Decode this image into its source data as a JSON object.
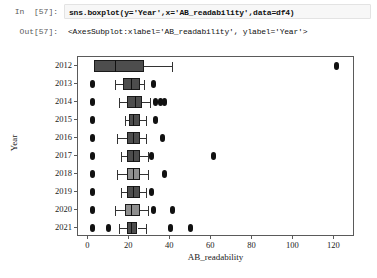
{
  "notebook": {
    "in_prompt": "In  [57]:",
    "out_prompt": "Out[57]:",
    "code": "sns.boxplot(y='Year',x='AB_readability',data=df4)",
    "output": "<AxesSubplot:xlabel='AB_readability', ylabel='Year'>"
  },
  "chart_data": {
    "type": "box",
    "title": "",
    "xlabel": "AB_readability",
    "ylabel": "Year",
    "orientation": "horizontal",
    "xlim": [
      -5,
      130
    ],
    "xticks": [
      0,
      20,
      40,
      60,
      80,
      100,
      120
    ],
    "xtick_labels": [
      "0",
      "20",
      "40",
      "60",
      "80",
      "100",
      "120"
    ],
    "grid": false,
    "legend": "none",
    "categories": [
      "2012",
      "2013",
      "2014",
      "2015",
      "2016",
      "2017",
      "2018",
      "2019",
      "2020",
      "2021"
    ],
    "boxes": [
      {
        "category": "2012",
        "whisker_low": 3,
        "q1": 3,
        "median": 13,
        "q3": 27,
        "whisker_high": 41,
        "outliers": [
          121
        ],
        "fill": "dark"
      },
      {
        "category": "2013",
        "whisker_low": 13,
        "q1": 17,
        "median": 21,
        "q3": 25,
        "whisker_high": 27,
        "outliers": [
          2,
          32
        ],
        "fill": "dark"
      },
      {
        "category": "2014",
        "whisker_low": 15,
        "q1": 19,
        "median": 23,
        "q3": 26,
        "whisker_high": 30,
        "outliers": [
          2,
          33,
          35,
          37
        ],
        "fill": "dark"
      },
      {
        "category": "2015",
        "whisker_low": 18,
        "q1": 20,
        "median": 22,
        "q3": 25,
        "whisker_high": 28,
        "outliers": [
          2,
          33
        ],
        "fill": "dark"
      },
      {
        "category": "2016",
        "whisker_low": 14,
        "q1": 19,
        "median": 22,
        "q3": 25,
        "whisker_high": 28,
        "outliers": [
          2,
          36
        ],
        "fill": "dark"
      },
      {
        "category": "2017",
        "whisker_low": 16,
        "q1": 19,
        "median": 22,
        "q3": 25,
        "whisker_high": 29,
        "outliers": [
          2,
          31,
          61
        ],
        "fill": "dark"
      },
      {
        "category": "2018",
        "whisker_low": 14,
        "q1": 19,
        "median": 22,
        "q3": 25,
        "whisker_high": 29,
        "outliers": [
          2,
          37
        ],
        "fill": "light"
      },
      {
        "category": "2019",
        "whisker_low": 16,
        "q1": 19,
        "median": 22,
        "q3": 25,
        "whisker_high": 28,
        "outliers": [
          2,
          31
        ],
        "fill": "dark"
      },
      {
        "category": "2020",
        "whisker_low": 13,
        "q1": 18,
        "median": 21,
        "q3": 25,
        "whisker_high": 29,
        "outliers": [
          2,
          32,
          41
        ],
        "fill": "light"
      },
      {
        "category": "2021",
        "whisker_low": 15,
        "q1": 19,
        "median": 21,
        "q3": 24,
        "whisker_high": 28,
        "outliers": [
          2,
          10,
          40,
          50
        ],
        "fill": "dark"
      }
    ]
  }
}
